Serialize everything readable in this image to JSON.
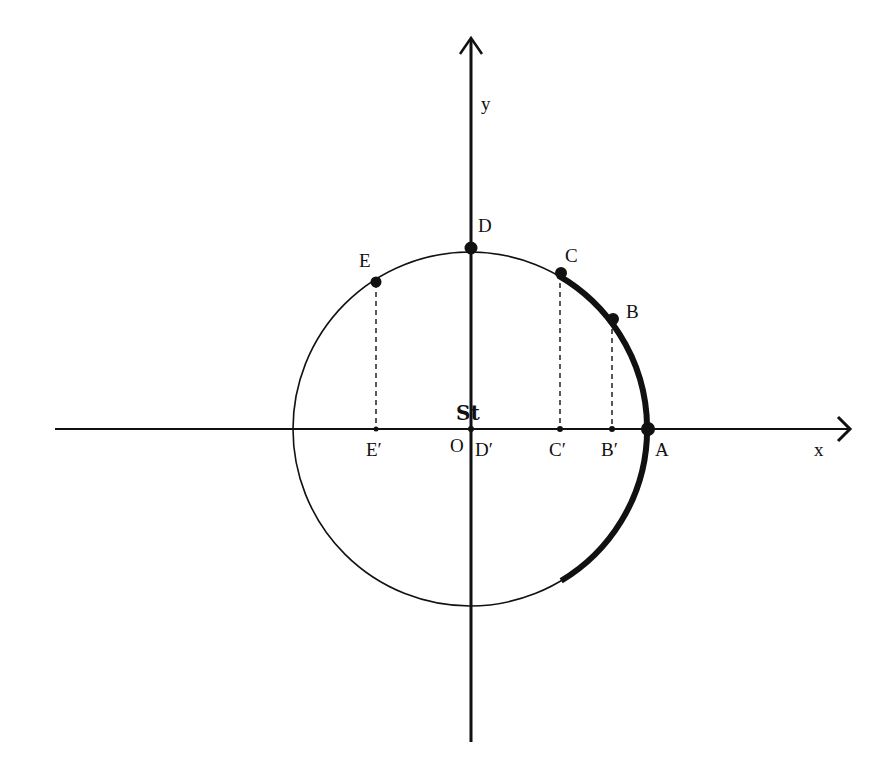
{
  "diagram": {
    "type": "unit-circle-projection",
    "axes": {
      "x_label": "x",
      "y_label": "y",
      "origin_label": "O",
      "origin_mark": "St"
    },
    "circle": {
      "center": [
        470,
        429
      ],
      "radius": 178
    },
    "points_on_circle": [
      {
        "name": "A",
        "label": "A",
        "angle_deg": 0
      },
      {
        "name": "B",
        "label": "B",
        "angle_deg": 36
      },
      {
        "name": "C",
        "label": "C",
        "angle_deg": 60
      },
      {
        "name": "D",
        "label": "D",
        "angle_deg": 90
      },
      {
        "name": "E",
        "label": "E",
        "angle_deg": 122
      }
    ],
    "projections_on_x_axis": [
      {
        "name": "B'",
        "label": "B′"
      },
      {
        "name": "C'",
        "label": "C′"
      },
      {
        "name": "D'",
        "label": "D′"
      },
      {
        "name": "E'",
        "label": "E′"
      }
    ],
    "highlighted_arc": {
      "from_angle_deg": 60,
      "to_angle_deg": -58,
      "style": "thick"
    },
    "colors": {
      "ink": "#111111",
      "background": "#ffffff"
    }
  }
}
